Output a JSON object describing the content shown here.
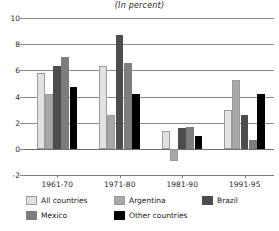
{
  "chart_data": {
    "type": "bar",
    "title": "(In percent)",
    "subtitle": "",
    "xlabel": "",
    "ylabel": "",
    "categories": [
      "1961-70",
      "1971-80",
      "1981-90",
      "1991-95"
    ],
    "ylim": [
      -2,
      10
    ],
    "yticks": [
      -2,
      0,
      2,
      4,
      6,
      8,
      10
    ],
    "ytick_labels": [
      "-2",
      "0",
      "2",
      "4",
      "6",
      "8",
      "10"
    ],
    "grid": true,
    "legend_position": "bottom",
    "series": [
      {
        "name": "All countries",
        "color": "#e2e2e2",
        "values": [
          5.8,
          6.3,
          1.4,
          3.0
        ]
      },
      {
        "name": "Argentina",
        "color": "#a8a8a8",
        "values": [
          4.2,
          2.6,
          -0.9,
          5.25
        ]
      },
      {
        "name": "Brazil",
        "color": "#4d4d4d",
        "values": [
          6.3,
          8.7,
          1.6,
          2.6
        ]
      },
      {
        "name": "Mexico",
        "color": "#7d7d7d",
        "values": [
          7.0,
          6.6,
          1.65,
          0.7
        ]
      },
      {
        "name": "Other countries",
        "color": "#000000",
        "values": [
          4.75,
          4.2,
          1.0,
          4.2
        ]
      }
    ]
  },
  "legend": {
    "items": [
      {
        "label": "All countries",
        "color": "#e2e2e2"
      },
      {
        "label": "Argentina",
        "color": "#a8a8a8"
      },
      {
        "label": "Brazil",
        "color": "#4d4d4d"
      },
      {
        "label": "Mexico",
        "color": "#7d7d7d"
      },
      {
        "label": "Other countries",
        "color": "#000000"
      }
    ]
  },
  "axis": {
    "y_tick_labels": [
      "10",
      "8",
      "6",
      "4",
      "2",
      "0",
      "-2"
    ],
    "x_tick_labels": [
      "1961-70",
      "1971-80",
      "1981-90",
      "1991-95"
    ]
  }
}
